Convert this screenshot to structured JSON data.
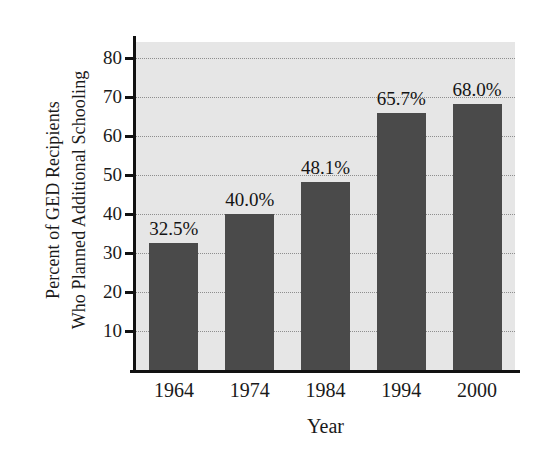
{
  "chart_data": {
    "type": "bar",
    "title": "",
    "xlabel": "Year",
    "ylabel": "Percent of GED Recipients Who Planned Additional Schooling",
    "ylabel_lines": [
      "Percent of GED Recipients",
      "Who Planned Additional Schooling"
    ],
    "categories": [
      "1964",
      "1974",
      "1984",
      "1994",
      "2000"
    ],
    "values": [
      32.5,
      40.0,
      48.1,
      65.7,
      68.0
    ],
    "data_labels": [
      "32.5%",
      "40.0%",
      "48.1%",
      "65.7%",
      "68.0%"
    ],
    "ylim": [
      0,
      84
    ],
    "yticks": [
      10,
      20,
      30,
      40,
      50,
      60,
      70,
      80
    ],
    "ytick_labels": [
      "10",
      "20",
      "30",
      "40",
      "50",
      "60",
      "70",
      "80"
    ],
    "grid": true,
    "grid_style": "dotted-horizontal",
    "legend": "none",
    "colors": {
      "bar": "#4a4a4a",
      "plot_background": "#e6e6e6",
      "gridline": "#8e8e8e",
      "axis": "#111111",
      "text": "#1a1a1a",
      "figure_background": "#ffffff"
    }
  }
}
